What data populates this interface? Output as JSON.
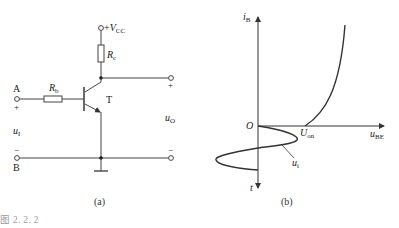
{
  "figure": {
    "caption": "图 2. 2. 2",
    "panel_a": {
      "label": "(a)",
      "supply": {
        "prefix": "+",
        "symbol": "V",
        "subscript": "CC"
      },
      "collector_resistor": {
        "symbol": "R",
        "subscript": "c"
      },
      "base_resistor": {
        "symbol": "R",
        "subscript": "b"
      },
      "transistor": "T",
      "input_terminal_top": "A",
      "input_terminal_bottom": "B",
      "input_plus": "+",
      "input_minus": "−",
      "output_plus": "+",
      "output_minus": "−",
      "input_voltage": {
        "symbol": "u",
        "subscript": "I"
      },
      "output_voltage": {
        "symbol": "u",
        "subscript": "O"
      }
    },
    "panel_b": {
      "label": "(b)",
      "y_axis": {
        "symbol": "i",
        "subscript": "B"
      },
      "x_axis": {
        "symbol": "u",
        "subscript": "BE"
      },
      "t_axis": "t",
      "origin": "O",
      "threshold": {
        "symbol": "U",
        "subscript": "on"
      },
      "signal_label": {
        "symbol": "u",
        "subscript": "i"
      }
    }
  },
  "colors": {
    "line": "#333333",
    "caption": "#9a9a9a"
  }
}
